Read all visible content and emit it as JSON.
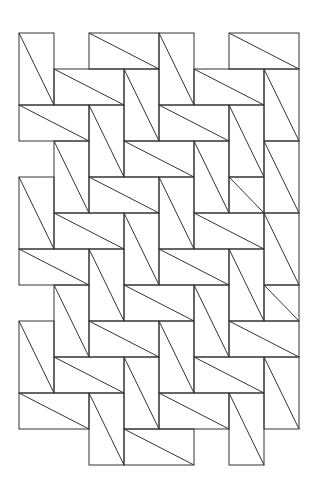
{
  "diagram": {
    "title": "",
    "origin": [
      19,
      33
    ],
    "unit": [
      35,
      36
    ],
    "stroke": "#333333",
    "rects": [
      [
        0,
        0,
        1,
        2
      ],
      [
        2,
        0,
        2,
        1
      ],
      [
        4,
        0,
        1,
        2
      ],
      [
        6,
        0,
        2,
        1
      ],
      [
        1,
        1,
        2,
        1
      ],
      [
        3,
        1,
        1,
        2
      ],
      [
        5,
        1,
        2,
        1
      ],
      [
        7,
        1,
        1,
        2
      ],
      [
        0,
        2,
        2,
        1
      ],
      [
        2,
        2,
        1,
        2
      ],
      [
        4,
        2,
        2,
        1
      ],
      [
        6,
        2,
        1,
        2
      ],
      [
        1,
        3,
        1,
        2
      ],
      [
        3,
        3,
        2,
        1
      ],
      [
        5,
        3,
        1,
        2
      ],
      [
        7,
        3,
        1,
        2
      ],
      [
        0,
        4,
        1,
        2
      ],
      [
        2,
        4,
        2,
        1
      ],
      [
        4,
        4,
        1,
        2
      ],
      [
        6,
        4,
        1,
        1
      ],
      [
        1,
        5,
        2,
        1
      ],
      [
        3,
        5,
        1,
        2
      ],
      [
        5,
        5,
        2,
        1
      ],
      [
        7,
        5,
        1,
        2
      ],
      [
        0,
        6,
        2,
        1
      ],
      [
        2,
        6,
        1,
        2
      ],
      [
        4,
        6,
        2,
        1
      ],
      [
        6,
        6,
        1,
        2
      ],
      [
        1,
        7,
        1,
        2
      ],
      [
        3,
        7,
        2,
        1
      ],
      [
        5,
        7,
        1,
        2
      ],
      [
        7,
        7,
        1,
        1
      ],
      [
        0,
        8,
        1,
        2
      ],
      [
        2,
        8,
        2,
        1
      ],
      [
        4,
        8,
        1,
        2
      ],
      [
        6,
        8,
        2,
        1
      ],
      [
        1,
        9,
        2,
        1
      ],
      [
        3,
        9,
        1,
        2
      ],
      [
        5,
        9,
        2,
        1
      ],
      [
        7,
        9,
        1,
        2
      ],
      [
        0,
        10,
        2,
        1
      ],
      [
        2,
        10,
        1,
        2
      ],
      [
        4,
        10,
        2,
        1
      ],
      [
        6,
        10,
        1,
        2
      ],
      [
        3,
        11,
        2,
        1
      ]
    ]
  }
}
